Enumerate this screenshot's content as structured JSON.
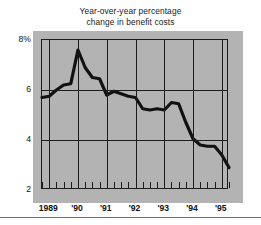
{
  "chart_data": {
    "type": "line",
    "title": "Year-over-year percentage change in benefit costs",
    "title_line1": "Year-over-year percentage",
    "title_line2": "change in benefit costs",
    "xlabel": "",
    "ylabel": "",
    "ylim": [
      2,
      8
    ],
    "xlim": [
      1988.75,
      1995.25
    ],
    "grid": true,
    "legend": "none",
    "y_ticks": [
      2,
      4,
      6,
      8
    ],
    "y_tick_labels": [
      "2",
      "4",
      "6",
      "8%"
    ],
    "x_ticks": [
      1989,
      1990,
      1991,
      1992,
      1993,
      1994,
      1995
    ],
    "x_tick_labels": [
      "1989",
      "'90",
      "'91",
      "'92",
      "'93",
      "'94",
      "'95"
    ],
    "x_minor_tick_interval": 0.25,
    "line_color": "#111111",
    "line_width": 3,
    "panel_color": "#b3b3b3",
    "background_color": "#ffffff",
    "x": [
      1988.75,
      1989.0,
      1989.25,
      1989.5,
      1989.75,
      1990.0,
      1990.25,
      1990.5,
      1990.75,
      1991.0,
      1991.25,
      1991.5,
      1991.75,
      1992.0,
      1992.25,
      1992.5,
      1992.75,
      1993.0,
      1993.25,
      1993.5,
      1993.75,
      1994.0,
      1994.25,
      1994.5,
      1994.75,
      1995.0,
      1995.25
    ],
    "values": [
      5.7,
      5.75,
      6.0,
      6.2,
      6.25,
      7.6,
      6.9,
      6.5,
      6.45,
      5.8,
      5.95,
      5.85,
      5.75,
      5.7,
      5.25,
      5.2,
      5.25,
      5.2,
      5.5,
      5.45,
      4.7,
      4.05,
      3.8,
      3.75,
      3.75,
      3.4,
      2.9
    ],
    "series": [
      {
        "name": "Year-over-year percentage change in benefit costs",
        "values": [
          5.7,
          5.75,
          6.0,
          6.2,
          6.25,
          7.6,
          6.9,
          6.5,
          6.45,
          5.8,
          5.95,
          5.85,
          5.75,
          5.7,
          5.25,
          5.2,
          5.25,
          5.2,
          5.5,
          5.45,
          4.7,
          4.05,
          3.8,
          3.75,
          3.75,
          3.4,
          2.9
        ]
      }
    ]
  }
}
